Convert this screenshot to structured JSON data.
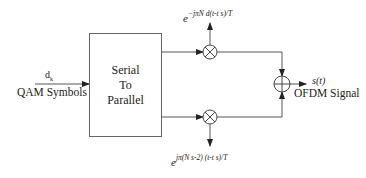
{
  "diagram": {
    "input": {
      "symbol": "d",
      "symbol_subscript": "k",
      "label": "QAM Symbols"
    },
    "block": {
      "lines": [
        "Serial",
        "To",
        "Parallel"
      ]
    },
    "top_branch": {
      "carrier_base": "e",
      "carrier_exponent": "− jπN₍₁₎(t-tₛ)/T",
      "carrier_exponent_display": "−jπN d(t-t s)/T"
    },
    "bottom_branch": {
      "carrier_base": "e",
      "carrier_exponent_display": "jπ(N s-2) (t-t s)/T"
    },
    "output": {
      "signal": "s(t)",
      "label": "OFDM Signal"
    },
    "colors": {
      "line": "#555555",
      "text": "#222222",
      "background": "#ffffff"
    }
  }
}
